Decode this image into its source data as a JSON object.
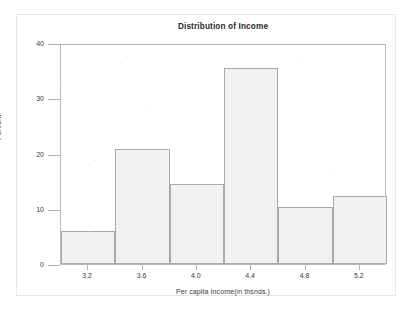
{
  "chart_data": {
    "type": "bar",
    "title": "Distribution of Income",
    "xlabel": "Per capita Income(in thsnds.)",
    "ylabel": "Percent",
    "grid": false,
    "legend": null,
    "xlim": [
      3.0,
      5.4
    ],
    "ylim": [
      0,
      40
    ],
    "y_ticks": [
      0,
      10,
      20,
      30,
      40
    ],
    "y_tick_labels": [
      "0",
      "10",
      "20",
      "30",
      "40"
    ],
    "x_ticks": [
      3.2,
      3.6,
      4.0,
      4.4,
      4.8,
      5.2
    ],
    "x_tick_labels": [
      "3.2",
      "3.6",
      "4.0",
      "4.4",
      "4.8",
      "5.2"
    ],
    "bin_width": 0.4,
    "bin_edges": [
      3.0,
      3.4,
      3.8,
      4.2,
      4.6,
      5.0,
      5.4
    ],
    "categories": [
      "3.0-3.4",
      "3.4-3.8",
      "3.8-4.2",
      "4.2-4.6",
      "4.6-5.0",
      "5.0-5.4"
    ],
    "bin_centers": [
      3.2,
      3.6,
      4.0,
      4.4,
      4.8,
      5.2
    ],
    "values": [
      6.0,
      20.8,
      14.5,
      35.4,
      10.3,
      12.3
    ],
    "bars": [
      {
        "label": "3.0-3.4",
        "center": 3.2,
        "left": 3.0,
        "right": 3.4,
        "value": 6.0
      },
      {
        "label": "3.4-3.8",
        "center": 3.6,
        "left": 3.4,
        "right": 3.8,
        "value": 20.8
      },
      {
        "label": "3.8-4.2",
        "center": 4.0,
        "left": 3.8,
        "right": 4.2,
        "value": 14.5
      },
      {
        "label": "4.2-4.6",
        "center": 4.4,
        "left": 4.2,
        "right": 4.6,
        "value": 35.4
      },
      {
        "label": "4.6-5.0",
        "center": 4.8,
        "left": 4.6,
        "right": 5.0,
        "value": 10.3
      },
      {
        "label": "5.0-5.4",
        "center": 5.2,
        "left": 5.0,
        "right": 5.4,
        "value": 12.3
      }
    ],
    "colors": {
      "bar_fill": "#f1f1f1",
      "bar_edge": "#a9a9a9",
      "axis": "#b0b0b0",
      "text": "#3a3a3a",
      "title": "#2a2a2a",
      "background": "#ffffff"
    }
  }
}
